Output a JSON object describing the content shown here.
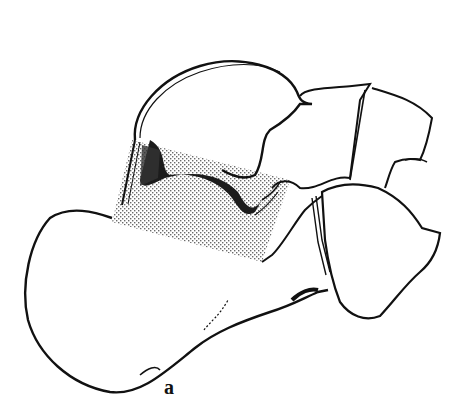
{
  "figure": {
    "panel_label": "a",
    "colors": {
      "line": "#111111",
      "background": "#ffffff",
      "stipple": "#8a8a8a",
      "dark_band": "#1c1c1c"
    }
  }
}
